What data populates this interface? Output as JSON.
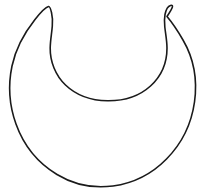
{
  "canvas": {
    "width": 217,
    "height": 194,
    "background_color": "#FFFFFF",
    "title": "Crescent Moon Outline"
  },
  "figure": {
    "name": "crescent-moon",
    "description": "Line-art outline of a crescent moon opening upward with two hooked horn tips",
    "stroke_color": "#1A1A1A",
    "fill_color": "#FFFFFF",
    "stroke_width": 1.6,
    "path": "M 48.5 6.5 C 44.5 7.5 40.5 12.5 35.0 19.5 C 25.5 31.5 16.0 47.0 12.0 66.0 C 8.0 85.0 9.5 106.0 16.0 124.0 C 23.5 145.0 38.0 163.0 57.0 174.5 C 74.0 184.8 94.0 188.5 113.0 186.0 C 133.0 183.3 152.0 173.8 166.5 159.0 C 181.5 143.8 191.5 123.5 194.5 102.0 C 197.5 80.5 193.5 58.0 183.0 40.0 C 178.0 31.3 172.5 23.0 167.0 16.5 C 173.0 7.5 174.0 4.5 170.5 5.5 C 167.5 6.4 166.0 9.5 165.0 14.5 C 164.3 18.3 164.3 22.5 164.8 27.0 C 165.6 34.0 167.0 41.0 167.0 48.0 C 167.0 62.5 161.0 76.5 150.5 86.0 C 139.0 96.4 123.0 101.0 107.5 100.8 C 92.0 100.6 76.5 95.5 65.5 85.0 C 55.5 75.5 50.0 61.5 50.2 48.0 C 50.3 40.5 51.8 33.0 52.3 26.0 C 52.7 21.0 52.5 16.5 51.5 12.5 C 50.7 9.0 50.0 6.2 48.5 6.5 Z",
    "geometry": {
      "left_horn_tip": [
        48,
        6
      ],
      "right_horn_tip": [
        170,
        6
      ],
      "leftmost_point": [
        11,
        100
      ],
      "rightmost_point": [
        196,
        100
      ],
      "bottom_point": [
        109,
        187
      ],
      "inner_arc_bottom": [
        108,
        101
      ]
    }
  }
}
